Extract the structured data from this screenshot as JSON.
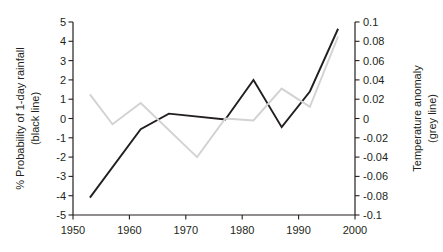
{
  "chart_data": {
    "type": "line",
    "title": "",
    "subtitle": "",
    "xlabel": "",
    "ylabel": "% Probability of 1-day rainfall (black line)",
    "y2label": "Temperature anomaly (grey line)",
    "grid": false,
    "legend_position": "none",
    "x": [
      1953,
      1957,
      1962,
      1967,
      1972,
      1977,
      1982,
      1987,
      1992,
      1997
    ],
    "xlim": [
      1950,
      2000
    ],
    "xticks": [
      1950,
      1960,
      1970,
      1980,
      1990,
      2000
    ],
    "xtick_labels": [
      "1950",
      "1960",
      "1970",
      "1980",
      "1990",
      "2000"
    ],
    "ylim": [
      -5,
      5
    ],
    "yticks": [
      5,
      4,
      3,
      2,
      1,
      0,
      -1,
      -2,
      -3,
      -4,
      -5
    ],
    "ytick_labels": [
      "5",
      "4",
      "3",
      "2",
      "1",
      "0",
      "-1",
      "-2",
      "-3",
      "-4",
      "-5"
    ],
    "y2lim": [
      -0.1,
      0.1
    ],
    "y2ticks": [
      0.1,
      0.08,
      0.06,
      0.04,
      0.02,
      0,
      -0.02,
      -0.04,
      -0.06,
      -0.08,
      -0.1
    ],
    "y2tick_labels": [
      "0.1",
      "0.08",
      "0.06",
      "0.04",
      "0.02",
      "0",
      "-0.02",
      "-0.04",
      "-0.06",
      "-0.08",
      "-0.1"
    ],
    "series": [
      {
        "name": "% Probability of 1-day rainfall",
        "color": "#231f20",
        "axis": "left",
        "x": [
          1953,
          1962,
          1967,
          1977,
          1982,
          1987,
          1992,
          1997
        ],
        "values": [
          -4.1,
          -0.55,
          0.25,
          -0.05,
          2.0,
          -0.45,
          1.4,
          4.65
        ]
      },
      {
        "name": "Temperature anomaly",
        "color": "#d2d2d2",
        "axis": "right",
        "x": [
          1953,
          1957,
          1962,
          1972,
          1977,
          1982,
          1987,
          1992,
          1997
        ],
        "values": [
          0.025,
          -0.006,
          0.016,
          -0.04,
          0.0,
          -0.002,
          0.031,
          0.012,
          0.085
        ]
      }
    ]
  },
  "axes": {
    "left_title_line1": "% Probability of 1-day rainfall",
    "left_title_line2": "(black line)",
    "right_title_line1": "Temperature anomaly",
    "right_title_line2": "(grey line)"
  }
}
